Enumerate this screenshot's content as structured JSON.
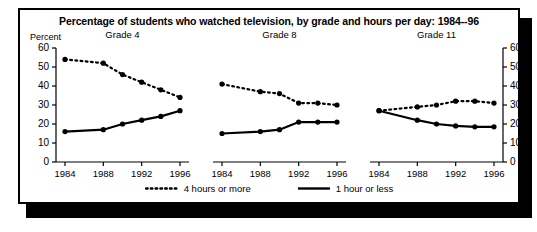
{
  "chart_title": "Percentage of students who watched television, by grade and hours per day: 1984--96",
  "axis": {
    "y_label": "Percent",
    "y_ticks": [
      0,
      10,
      20,
      30,
      40,
      50,
      60
    ],
    "x_tick_labels": [
      "1984",
      "1988",
      "1992",
      "1996"
    ]
  },
  "legend": {
    "items": [
      {
        "label": "4 hours or more",
        "style": "dotted"
      },
      {
        "label": "1 hour or less",
        "style": "solid"
      }
    ]
  },
  "panels": [
    {
      "title": "Grade 4"
    },
    {
      "title": "Grade 8"
    },
    {
      "title": "Grade 11"
    }
  ],
  "colors": {
    "line": "#000000",
    "frame": "#000000",
    "background": "#ffffff",
    "shadow": "#000000"
  },
  "chart_data": {
    "type": "line",
    "title": "Percentage of students who watched television, by grade and hours per day: 1984--96",
    "xlabel": "",
    "ylabel": "Percent",
    "ylim": [
      0,
      60
    ],
    "yticks": [
      0,
      10,
      20,
      30,
      40,
      50,
      60
    ],
    "grid": false,
    "legend_position": "bottom",
    "x": [
      1984,
      1986,
      1988,
      1990,
      1992,
      1994,
      1996
    ],
    "panels": [
      {
        "name": "Grade 4",
        "series": [
          {
            "name": "4 hours or more",
            "style": "dotted",
            "x": [
              1984,
              1988,
              1990,
              1992,
              1994,
              1996
            ],
            "values": [
              54,
              52,
              46,
              42,
              38,
              34
            ]
          },
          {
            "name": "1 hour or less",
            "style": "solid",
            "x": [
              1984,
              1988,
              1990,
              1992,
              1994,
              1996
            ],
            "values": [
              16,
              17,
              20,
              22,
              24,
              27
            ]
          }
        ]
      },
      {
        "name": "Grade 8",
        "series": [
          {
            "name": "4 hours or more",
            "style": "dotted",
            "x": [
              1984,
              1988,
              1990,
              1992,
              1994,
              1996
            ],
            "values": [
              41,
              37,
              36,
              31,
              31,
              30
            ]
          },
          {
            "name": "1 hour or less",
            "style": "solid",
            "x": [
              1984,
              1988,
              1990,
              1992,
              1994,
              1996
            ],
            "values": [
              15,
              16,
              17,
              21,
              21,
              21
            ]
          }
        ]
      },
      {
        "name": "Grade 11",
        "series": [
          {
            "name": "4 hours or more",
            "style": "dotted",
            "x": [
              1984,
              1988,
              1990,
              1992,
              1994,
              1996
            ],
            "values": [
              27,
              29,
              30,
              32,
              32,
              31
            ]
          },
          {
            "name": "1 hour or less",
            "style": "solid",
            "x": [
              1984,
              1988,
              1990,
              1992,
              1994,
              1996
            ],
            "values": [
              27,
              22,
              20,
              19,
              18.5,
              18.5
            ]
          }
        ]
      }
    ]
  }
}
